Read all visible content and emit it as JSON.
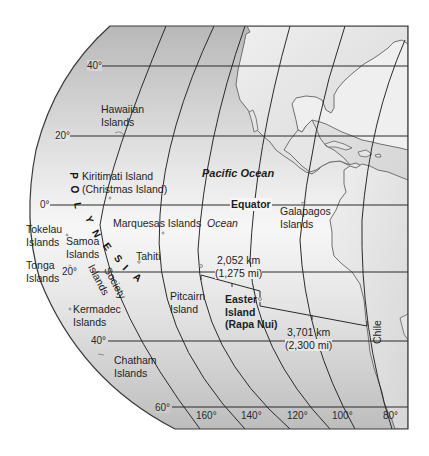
{
  "map": {
    "title_region": "Pacific Ocean — Polynesia to South America",
    "colors": {
      "ocean_light": "#f4f4f4",
      "ocean_dark": "#c4c4c4",
      "land": "#e2e2e2",
      "grid": "#2b2b2b",
      "frame": "#3a3a3a"
    },
    "latitude_labels": [
      "40°",
      "20°",
      "0°",
      "20°",
      "40°",
      "60°"
    ],
    "longitude_labels": [
      "160°",
      "140°",
      "120°",
      "100°",
      "80°"
    ],
    "equator_label": "Equator",
    "ocean_labels": {
      "pacific": "Pacific Ocean",
      "ocean": "Ocean"
    },
    "region_label": {
      "polynesia_letters": [
        "P",
        "O",
        "L",
        "Y",
        "N",
        "E",
        "S",
        "I",
        "A"
      ]
    },
    "places": {
      "hawaiian": [
        "Hawaiian",
        "Islands"
      ],
      "kiritimati": [
        "Kiritimati Island",
        "(Christmas Island)"
      ],
      "marquesas": "Marquesas Islands",
      "galapagos": [
        "Galapagos",
        "Islands"
      ],
      "tokelau": [
        "Tokelau",
        "Islands"
      ],
      "samoa": [
        "Samoa",
        "Islands"
      ],
      "tonga": [
        "Tonga",
        "Islands"
      ],
      "tahiti": "Tahiti",
      "society": [
        "Society",
        "Islands"
      ],
      "kermadec": [
        "Kermadec",
        "Islands"
      ],
      "pitcairn": [
        "Pitcairn",
        "Island"
      ],
      "easter": [
        "Easter",
        "Island",
        "(Rapa Nui)"
      ],
      "chatham": [
        "Chatham",
        "Islands"
      ],
      "chile": "Chile"
    },
    "distances": {
      "pitcairn_easter": [
        "2,052 km",
        "(1,275 mi)"
      ],
      "easter_chile": [
        "3,701 km",
        "(2,300 mi)"
      ]
    }
  }
}
